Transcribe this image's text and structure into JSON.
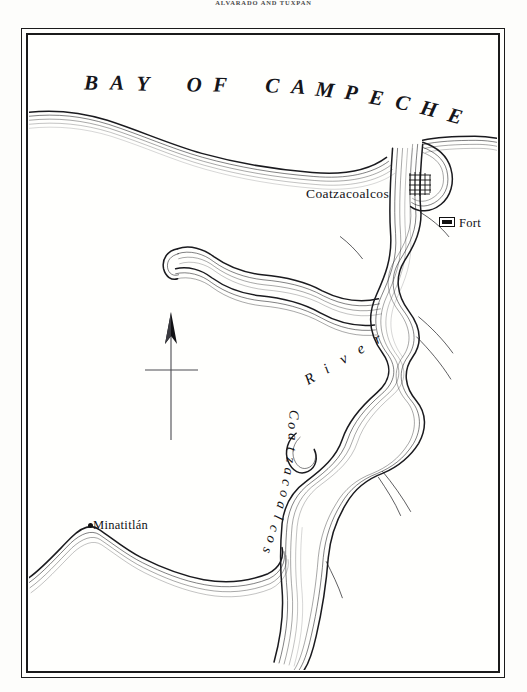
{
  "page": {
    "running_head": "ALVARADO AND TUXPAN",
    "background_color": "#fdfdfb",
    "ink_color": "#15151a"
  },
  "map": {
    "title": "BAY OF CAMPECHE",
    "frame": {
      "outer_border_color": "#1b1b1b",
      "inner_border_color": "#1b1b1b"
    },
    "water_body": "Bay of Campeche",
    "river_label_upper": "River",
    "river_label_lower": "Coatzacoalcos",
    "river_full_name": "Coatzacoalcos River",
    "labels": [
      {
        "name": "Coatzacoalcos",
        "symbol": "town-grid",
        "x": 277,
        "y": 150
      },
      {
        "name": "Minatitlán",
        "symbol": "dot",
        "x": 64,
        "y": 482
      },
      {
        "name": "Fort",
        "symbol": "filled-rectangle",
        "x": 430,
        "y": 180
      }
    ],
    "legend": [
      {
        "symbol": "filled-rectangle",
        "label": "Fort"
      }
    ],
    "compass": {
      "direction": "north",
      "style": "arrow-with-crossbar"
    }
  }
}
